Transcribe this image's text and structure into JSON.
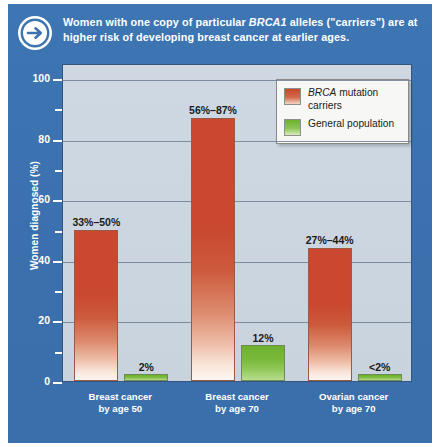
{
  "header": {
    "icon": "arrow-right-circle-icon",
    "text_before": "Women with one copy of particular ",
    "text_italic": "BRCA1",
    "text_after": " alleles (\"carriers\") are at higher risk of developing breast cancer at earlier ages."
  },
  "legend": {
    "items": [
      {
        "name": "BRCA mutation carriers",
        "italic_part": "BRCA",
        "rest": " mutation carriers",
        "color": "#c9482f"
      },
      {
        "name": "General population",
        "italic_part": "",
        "rest": "General population",
        "color": "#6db12e"
      }
    ]
  },
  "chart_data": {
    "type": "bar",
    "title": "",
    "xlabel": "",
    "ylabel": "Women diagnosed (%)",
    "ylim": [
      0,
      105
    ],
    "yticks": [
      0,
      20,
      40,
      60,
      80,
      100
    ],
    "ytick_labels": [
      "0",
      "20",
      "40",
      "60",
      "80",
      "100"
    ],
    "minor_yticks": [
      10,
      30,
      50,
      70,
      90
    ],
    "grid": true,
    "legend_position": "top-right",
    "categories": [
      "Breast cancer by age 50",
      "Breast cancer by age 70",
      "Ovarian cancer by age 70"
    ],
    "category_lines": [
      [
        "Breast cancer",
        "by age 50"
      ],
      [
        "Breast cancer",
        "by age 70"
      ],
      [
        "Ovarian cancer",
        "by age 70"
      ]
    ],
    "series": [
      {
        "name": "BRCA mutation carriers",
        "color": "#c9482f",
        "values": [
          50,
          87,
          44
        ],
        "ranges": [
          [
            33,
            50
          ],
          [
            56,
            87
          ],
          [
            27,
            44
          ]
        ],
        "labels": [
          "33%–50%",
          "56%–87%",
          "27%–44%"
        ]
      },
      {
        "name": "General population",
        "color": "#6db12e",
        "values": [
          2,
          12,
          2
        ],
        "ranges": [
          [
            0,
            2
          ],
          [
            0,
            12
          ],
          [
            0,
            2
          ]
        ],
        "labels": [
          "2%",
          "12%",
          "<2%"
        ]
      }
    ]
  },
  "colors": {
    "panel_blue": "#3c74b0",
    "plot_background": "#ccd6e0",
    "carrier_red": "#c9482f",
    "general_green": "#6db12e"
  }
}
